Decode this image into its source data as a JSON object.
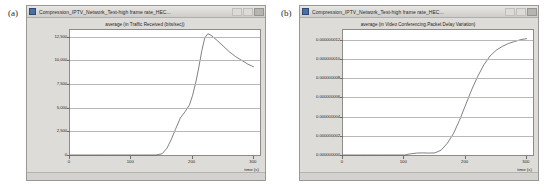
{
  "figure": {
    "panels": [
      {
        "letter": "(a)",
        "window": {
          "title": "Compression_IPTV_Network_Test-high frame rate_HEC...",
          "icon": "window-app-icon",
          "buttons": [
            "minimize",
            "maximize",
            "close"
          ]
        },
        "chart_data": {
          "type": "line",
          "title": "average (in Traffic Received (bits/sec))",
          "xlabel": "time (s)",
          "ylabel": "",
          "xlim": [
            0,
            310
          ],
          "ylim": [
            0,
            13200
          ],
          "xticks": [
            0,
            100,
            200,
            300
          ],
          "xtick_labels": [
            "0",
            "100",
            "200",
            "300"
          ],
          "yticks": [
            0,
            2500,
            5000,
            7500,
            10000,
            12500
          ],
          "ytick_labels": [
            "0",
            "2,500",
            "5,000",
            "7,500",
            "10,000",
            "12,500"
          ],
          "grid": true,
          "legend": "none",
          "series": [
            {
              "name": "Traffic Received (bits/sec)",
              "color": "#4a4a4a",
              "x": [
                0,
                20,
                40,
                60,
                80,
                100,
                120,
                140,
                150,
                158,
                165,
                172,
                180,
                188,
                195,
                200,
                205,
                210,
                215,
                220,
                225,
                230,
                240,
                250,
                260,
                270,
                280,
                290,
                300
              ],
              "y": [
                0,
                0,
                0,
                0,
                0,
                0,
                0,
                0,
                120,
                700,
                1600,
                2700,
                3900,
                4600,
                5300,
                6300,
                7600,
                9200,
                11000,
                12400,
                12800,
                12650,
                12100,
                11500,
                10900,
                10400,
                10000,
                9600,
                9300
              ]
            }
          ]
        }
      },
      {
        "letter": "(b)",
        "window": {
          "title": "Compression_IPTV_Network_Test-high frame rate_HEC...",
          "icon": "window-app-icon",
          "buttons": [
            "minimize",
            "maximize",
            "close"
          ]
        },
        "chart_data": {
          "type": "line",
          "title": "average (in Video Conferencing.Packet Delay Variation)",
          "xlabel": "time (s)",
          "ylabel": "",
          "xlim": [
            0,
            310
          ],
          "ylim": [
            0,
            1.3e-08
          ],
          "xticks": [
            0,
            100,
            200,
            300
          ],
          "xtick_labels": [
            "0",
            "100",
            "200",
            "300"
          ],
          "yticks": [
            0.0,
            2e-09,
            4e-09,
            6e-09,
            8e-09,
            1e-08,
            1.2e-08
          ],
          "ytick_labels": [
            "0.000000000",
            "0.000000002",
            "0.000000004",
            "0.000000006",
            "0.000000008",
            "0.000000010",
            "0.000000012"
          ],
          "grid": true,
          "legend": "none",
          "series": [
            {
              "name": "Video Conferencing.Packet Delay Variation",
              "color": "#4a4a4a",
              "x": [
                0,
                20,
                40,
                60,
                80,
                100,
                110,
                120,
                130,
                140,
                150,
                160,
                170,
                180,
                190,
                200,
                210,
                220,
                230,
                240,
                250,
                260,
                270,
                280,
                290,
                300
              ],
              "y": [
                0,
                0,
                0,
                0,
                0,
                0,
                1.2e-10,
                2e-10,
                2.2e-10,
                2e-10,
                2.2e-10,
                5e-10,
                1.2e-09,
                2.2e-09,
                3.6e-09,
                5.2e-09,
                6.8e-09,
                8.2e-09,
                9.4e-09,
                1.03e-08,
                1.09e-08,
                1.13e-08,
                1.16e-08,
                1.18e-08,
                1.2e-08,
                1.21e-08
              ]
            }
          ]
        }
      }
    ]
  }
}
